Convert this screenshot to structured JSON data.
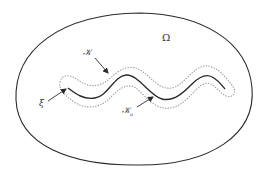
{
  "diagram": {
    "labels": {
      "omega": "Ω",
      "k": "𝒦",
      "k0_main": "𝒦",
      "k0_sub": "o",
      "xi": "ξ"
    },
    "colors": {
      "stroke": "#2a2a2a",
      "dotted": "#9a9a9a",
      "background": "#ffffff"
    }
  }
}
